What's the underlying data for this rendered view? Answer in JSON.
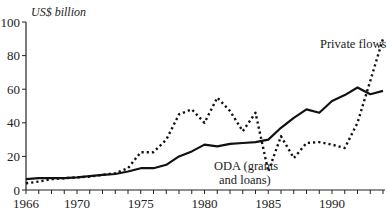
{
  "chart_data": {
    "type": "line",
    "title": "",
    "xlabel": "",
    "ylabel": "US$ billion",
    "xlim": [
      1966,
      1994
    ],
    "ylim": [
      0,
      100
    ],
    "grid": false,
    "legend_position": "inline annotations",
    "x": [
      1966,
      1967,
      1968,
      1969,
      1970,
      1971,
      1972,
      1973,
      1974,
      1975,
      1976,
      1977,
      1978,
      1979,
      1980,
      1981,
      1982,
      1983,
      1984,
      1985,
      1986,
      1987,
      1988,
      1989,
      1990,
      1991,
      1992,
      1993,
      1994
    ],
    "x_tick_labels": [
      "1966",
      "1970",
      "1975",
      "1980",
      "1985",
      "1990"
    ],
    "y_tick_labels": [
      "0",
      "20",
      "40",
      "60",
      "80",
      "100"
    ],
    "series": [
      {
        "name": "ODA (grants and loans)",
        "style": "solid",
        "values": [
          6.5,
          7,
          7,
          7,
          7.5,
          8.3,
          9,
          9.5,
          11,
          13,
          13,
          15,
          20,
          23,
          27,
          26,
          27.5,
          28,
          28.5,
          30,
          37,
          43,
          48,
          46,
          53,
          56.5,
          61,
          57,
          59
        ]
      },
      {
        "name": "Private flows",
        "style": "dotted",
        "values": [
          4,
          5,
          6.5,
          7,
          7.5,
          8,
          9,
          10,
          13,
          22.5,
          22.5,
          30,
          45,
          48,
          40,
          55,
          47,
          35,
          46,
          11,
          32,
          19,
          28,
          28.5,
          27,
          25,
          40,
          65,
          90
        ]
      }
    ],
    "annotations": [
      {
        "text_line1": "ODA (grants",
        "text_line2": "and loans)",
        "near_series": "ODA (grants and loans)"
      },
      {
        "text_line1": "Private flows",
        "near_series": "Private flows"
      }
    ]
  },
  "labels": {
    "ylabel": "US$ billion",
    "oda_line1": "ODA (grants",
    "oda_line2": "and loans)",
    "private": "Private flows"
  }
}
